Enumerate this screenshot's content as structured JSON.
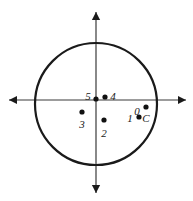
{
  "figure": {
    "width": 193,
    "height": 201,
    "background_color": "#ffffff",
    "stroke_color": "#1a1a1a",
    "axis_color": "#3a3a3a"
  },
  "circle": {
    "name": "circle",
    "center_x": 96,
    "center_y": 104,
    "radius": 61,
    "stroke_width": 2.2,
    "fill": "none"
  },
  "axes": {
    "horizontal": {
      "name": "x-axis",
      "y": 100,
      "x_start": 9,
      "x_end": 186,
      "double_headed": true
    },
    "vertical": {
      "name": "y-axis",
      "x": 96,
      "y_start": 12,
      "y_end": 193,
      "double_headed": true
    },
    "stroke_width": 1.2,
    "arrow_size": 7
  },
  "points": [
    {
      "id": "p0",
      "label": "0",
      "dot_x": 138,
      "dot_y": 103,
      "label_x": 137,
      "label_y": 111,
      "has_dot": false
    },
    {
      "id": "p1",
      "label": "1",
      "dot_x": 139,
      "dot_y": 117,
      "label_x": 130,
      "label_y": 118,
      "has_dot": true
    },
    {
      "id": "p2",
      "label": "2",
      "dot_x": 104,
      "dot_y": 120,
      "label_x": 104,
      "label_y": 133,
      "has_dot": true
    },
    {
      "id": "p3",
      "label": "3",
      "dot_x": 82,
      "dot_y": 112,
      "label_x": 82,
      "label_y": 124,
      "has_dot": true
    },
    {
      "id": "p4",
      "label": "4",
      "dot_x": 105,
      "dot_y": 97,
      "label_x": 113,
      "label_y": 96,
      "has_dot": true
    },
    {
      "id": "p5",
      "label": "5",
      "dot_x": 96,
      "dot_y": 99,
      "label_x": 88,
      "label_y": 96,
      "has_dot": true
    },
    {
      "id": "pc",
      "label": "C",
      "dot_x": 146,
      "dot_y": 107,
      "label_x": 146,
      "label_y": 118,
      "has_dot": true
    }
  ],
  "dot_radius": 2.6,
  "dot_color": "#111111"
}
